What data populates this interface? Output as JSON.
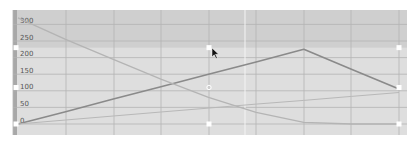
{
  "chart_data": {
    "type": "line",
    "title": "",
    "xlabel": "",
    "ylabel": "",
    "ylim": [
      0,
      320
    ],
    "grid": true,
    "legend": null,
    "y_ticks": [
      "300",
      "250",
      "200",
      "150",
      "100",
      "50",
      "0"
    ],
    "x": [
      0,
      1,
      2,
      3,
      4,
      5,
      6,
      7,
      8
    ],
    "series": [
      {
        "name": "dark-line",
        "values": [
          0,
          37,
          75,
          112,
          150,
          187,
          225,
          165,
          105
        ]
      },
      {
        "name": "light-curve",
        "values": [
          320,
          255,
          195,
          135,
          80,
          35,
          5,
          0,
          0
        ]
      },
      {
        "name": "faint-line",
        "values": [
          0,
          12,
          24,
          36,
          48,
          60,
          71,
          83,
          95
        ]
      }
    ],
    "highlight_band": {
      "from": 0,
      "to": 230
    },
    "handles": {
      "left": [
        230,
        110,
        0
      ],
      "middle": [
        230,
        110,
        0
      ],
      "right": [
        230,
        110,
        0
      ]
    },
    "cursor": {
      "x": 212,
      "y": 48
    }
  },
  "colors": {
    "background_top": "#cfcfcf",
    "background_band": "#dedede",
    "gridline": "#b4b4b4",
    "axis_strip": "#a8a8a8",
    "dark_line": "#8a8a8a",
    "light_curve": "#b4b4b4",
    "faint_line": "#b8b8b8",
    "handle": "#ffffff"
  }
}
